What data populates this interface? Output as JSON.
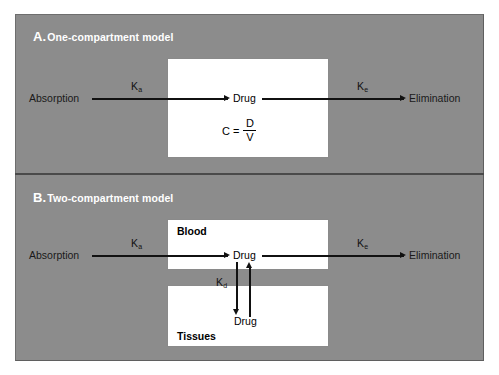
{
  "figure": {
    "panels": [
      {
        "letter": "A.",
        "title": "One-compartment model",
        "input_label": "Absorption",
        "output_label": "Elimination",
        "absorption_rate": "K",
        "absorption_rate_sub": "a",
        "elimination_rate": "K",
        "elimination_rate_sub": "e",
        "compartment": {
          "drug_label": "Drug",
          "formula": {
            "lhs": "C",
            "equals": "=",
            "numerator": "D",
            "denominator": "V"
          }
        }
      },
      {
        "letter": "B.",
        "title": "Two-compartment model",
        "input_label": "Absorption",
        "output_label": "Elimination",
        "absorption_rate": "K",
        "absorption_rate_sub": "a",
        "elimination_rate": "K",
        "elimination_rate_sub": "e",
        "distribution_rate": "K",
        "distribution_rate_sub": "d",
        "compartments": [
          {
            "name": "Blood",
            "drug_label": "Drug"
          },
          {
            "name": "Tissues",
            "drug_label": "Drug"
          }
        ]
      }
    ]
  },
  "colors": {
    "panel_background": "#8c8c8c",
    "box_fill": "#ffffff",
    "title_text": "#ffffff",
    "arrow": "#111111",
    "page_background": "#ffffff"
  }
}
